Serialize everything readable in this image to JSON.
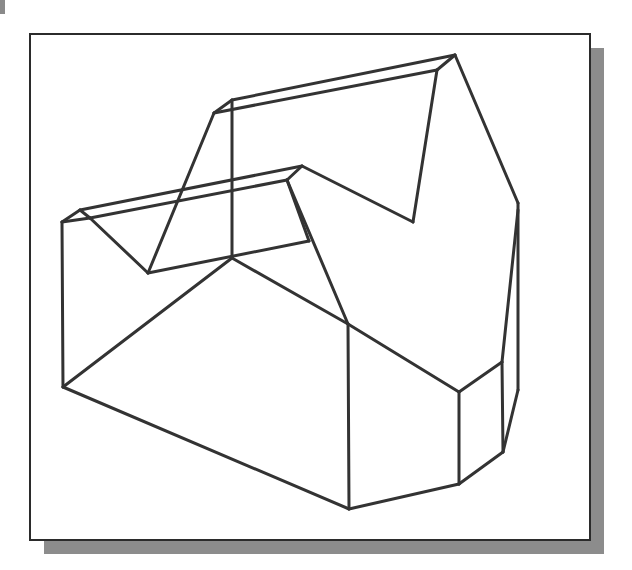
{
  "figure": {
    "type": "isometric-wireframe",
    "line_color": "#333333",
    "line_width": 3,
    "frame_border_color": "#2b2b2b",
    "shadow_color": "#8c8c8c",
    "background": "#ffffff"
  },
  "vertices": {
    "A": [
      62,
      222
    ],
    "B": [
      80,
      210
    ],
    "C": [
      90,
      218
    ],
    "D": [
      148,
      273
    ],
    "E": [
      214,
      113
    ],
    "F": [
      232,
      100
    ],
    "G": [
      232,
      258
    ],
    "H": [
      302,
      166
    ],
    "I": [
      287,
      180
    ],
    "J": [
      309,
      241
    ],
    "K": [
      455,
      55
    ],
    "L": [
      437,
      70
    ],
    "M": [
      413,
      222
    ],
    "N": [
      518,
      203
    ],
    "O": [
      518,
      210
    ],
    "P": [
      63,
      387
    ],
    "Q": [
      348,
      324
    ],
    "R": [
      349,
      509
    ],
    "S": [
      459,
      392
    ],
    "T": [
      502,
      362
    ],
    "U": [
      459,
      484
    ],
    "V": [
      503,
      452
    ],
    "W": [
      518,
      390
    ]
  },
  "edges": [
    [
      "A",
      "B"
    ],
    [
      "A",
      "C"
    ],
    [
      "B",
      "C"
    ],
    [
      "B",
      "H"
    ],
    [
      "C",
      "I"
    ],
    [
      "H",
      "I"
    ],
    [
      "C",
      "D"
    ],
    [
      "D",
      "E"
    ],
    [
      "E",
      "F"
    ],
    [
      "E",
      "L"
    ],
    [
      "F",
      "K"
    ],
    [
      "K",
      "L"
    ],
    [
      "F",
      "G"
    ],
    [
      "D",
      "J"
    ],
    [
      "I",
      "J"
    ],
    [
      "I",
      "Q"
    ],
    [
      "H",
      "M"
    ],
    [
      "L",
      "M"
    ],
    [
      "K",
      "N"
    ],
    [
      "N",
      "W"
    ],
    [
      "O",
      "T"
    ],
    [
      "A",
      "P"
    ],
    [
      "P",
      "G"
    ],
    [
      "G",
      "Q"
    ],
    [
      "P",
      "R"
    ],
    [
      "Q",
      "R"
    ],
    [
      "Q",
      "S"
    ],
    [
      "S",
      "T"
    ],
    [
      "S",
      "U"
    ],
    [
      "T",
      "V"
    ],
    [
      "R",
      "U"
    ],
    [
      "U",
      "V"
    ],
    [
      "V",
      "W"
    ]
  ]
}
